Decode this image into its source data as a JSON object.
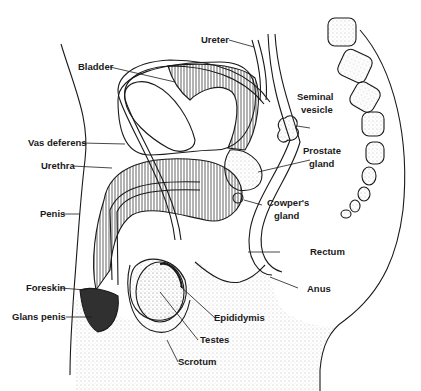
{
  "diagram": {
    "colors": {
      "ink": "#1a1a1a",
      "background": "#ffffff",
      "stipple": "#9a9a9a"
    },
    "labels": [
      {
        "id": "ureter",
        "text": "Ureter"
      },
      {
        "id": "bladder",
        "text": "Bladder"
      },
      {
        "id": "seminal-vesicle-1",
        "text": "Seminal"
      },
      {
        "id": "seminal-vesicle-2",
        "text": "vesicle"
      },
      {
        "id": "vas-deferens",
        "text": "Vas deferens"
      },
      {
        "id": "prostate-1",
        "text": "Prostate"
      },
      {
        "id": "prostate-2",
        "text": "gland"
      },
      {
        "id": "urethra",
        "text": "Urethra"
      },
      {
        "id": "cowpers-1",
        "text": "Cowper's"
      },
      {
        "id": "cowpers-2",
        "text": "gland"
      },
      {
        "id": "penis",
        "text": "Penis"
      },
      {
        "id": "rectum",
        "text": "Rectum"
      },
      {
        "id": "anus",
        "text": "Anus"
      },
      {
        "id": "foreskin",
        "text": "Foreskin"
      },
      {
        "id": "epididymis",
        "text": "Epididymis"
      },
      {
        "id": "glans-penis",
        "text": "Glans penis"
      },
      {
        "id": "testes",
        "text": "Testes"
      },
      {
        "id": "scrotum",
        "text": "Scrotum"
      }
    ]
  }
}
